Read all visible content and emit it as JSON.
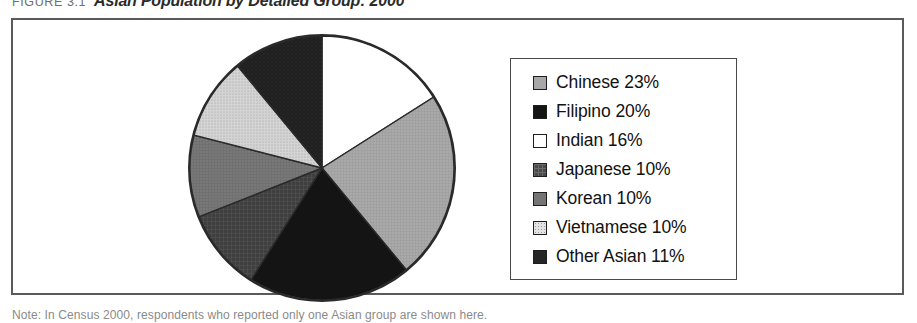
{
  "figure": {
    "label": "FIGURE 3.1",
    "title": "Asian Population by Detailed Group: 2000",
    "source_note": "Note: In Census 2000, respondents who reported only one Asian group are shown here."
  },
  "chart_data": {
    "type": "pie",
    "title": "Asian Population by Detailed Group: 2000",
    "xlabel": "",
    "ylabel": "",
    "legend_position": "right",
    "start_angle_deg": 0,
    "direction": "clockwise",
    "categories": [
      "Indian",
      "Chinese",
      "Filipino",
      "Japanese",
      "Korean",
      "Vietnamese",
      "Other Asian"
    ],
    "values": [
      16,
      23,
      20,
      10,
      10,
      10,
      11
    ],
    "unit": "percent",
    "slices": [
      {
        "label": "Indian",
        "value": 16,
        "display": "Indian 16%",
        "color": "#ffffff",
        "texture": "solid"
      },
      {
        "label": "Chinese",
        "value": 23,
        "display": "Chinese 23%",
        "color": "#a8a8a8",
        "texture": "solid"
      },
      {
        "label": "Filipino",
        "value": 20,
        "display": "Filipino 20%",
        "color": "#141414",
        "texture": "solid"
      },
      {
        "label": "Japanese",
        "value": 10,
        "display": "Japanese 10%",
        "color": "#4a4a4a",
        "texture": "grid"
      },
      {
        "label": "Korean",
        "value": 10,
        "display": "Korean 10%",
        "color": "#747474",
        "texture": "solid"
      },
      {
        "label": "Vietnamese",
        "value": 10,
        "display": "Vietnamese 10%",
        "color": "#cfcfcf",
        "texture": "dots"
      },
      {
        "label": "Other Asian",
        "value": 11,
        "display": "Other Asian 11%",
        "color": "#262626",
        "texture": "solid"
      }
    ]
  },
  "legend": {
    "items": [
      {
        "label": "Chinese 23%",
        "swatch": "#a8a8a8"
      },
      {
        "label": "Filipino 20%",
        "swatch": "#141414"
      },
      {
        "label": "Indian 16%",
        "swatch": "#ffffff"
      },
      {
        "label": "Japanese 10%",
        "swatch": "#4a4a4a"
      },
      {
        "label": "Korean 10%",
        "swatch": "#747474"
      },
      {
        "label": "Vietnamese 10%",
        "swatch": "#cfcfcf"
      },
      {
        "label": "Other Asian 11%",
        "swatch": "#262626"
      }
    ]
  }
}
